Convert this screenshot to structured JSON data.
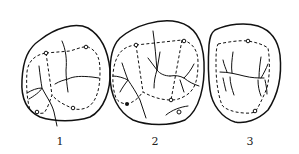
{
  "figure": {
    "type": "line-drawing",
    "panels": [
      {
        "label": "1",
        "x": 60
      },
      {
        "label": "2",
        "x": 155
      },
      {
        "label": "3",
        "x": 250
      }
    ],
    "colors": {
      "ink": "#111111",
      "background": "#ffffff"
    }
  }
}
